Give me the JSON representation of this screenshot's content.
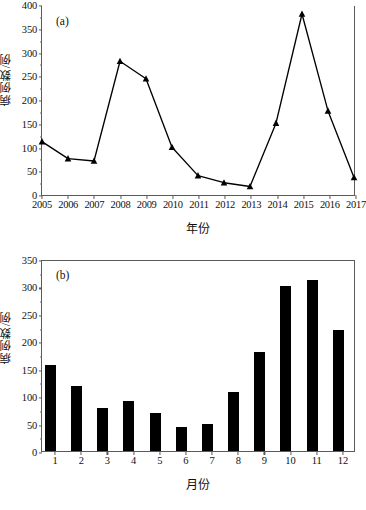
{
  "figure": {
    "background": "#ffffff",
    "line_color": "#000000",
    "bar_color": "#000000",
    "axis_color": "#5a5a5a"
  },
  "panel_a": {
    "tag": "(a)",
    "xlabel": "年份",
    "ylabel": "病例数/例"
  },
  "panel_b": {
    "tag": "(b)",
    "xlabel": "月份",
    "ylabel": "病例数/例"
  },
  "chart_data": [
    {
      "type": "line",
      "panel": "(a)",
      "title": "",
      "xlabel": "年份",
      "ylabel": "病例数/例",
      "categories": [
        "2005",
        "2006",
        "2007",
        "2008",
        "2009",
        "2010",
        "2011",
        "2012",
        "2013",
        "2014",
        "2015",
        "2016",
        "2017"
      ],
      "values": [
        113,
        77,
        72,
        283,
        246,
        101,
        41,
        26,
        18,
        152,
        383,
        178,
        37
      ],
      "marker": "triangle-filled",
      "ylim": [
        0,
        400
      ],
      "yticks": [
        0,
        50,
        100,
        150,
        200,
        250,
        300,
        350,
        400
      ],
      "ytick_labels": [
        "0",
        "50",
        "100",
        "150",
        "200",
        "250",
        "300",
        "350",
        "400"
      ],
      "grid": false,
      "legend": "none"
    },
    {
      "type": "bar",
      "panel": "(b)",
      "title": "",
      "xlabel": "月份",
      "ylabel": "病例数/例",
      "categories": [
        "1",
        "2",
        "3",
        "4",
        "5",
        "6",
        "7",
        "8",
        "9",
        "10",
        "11",
        "12"
      ],
      "values": [
        157,
        118,
        79,
        92,
        69,
        43,
        50,
        107,
        181,
        300,
        311,
        221
      ],
      "ylim": [
        0,
        350
      ],
      "yticks": [
        0,
        50,
        100,
        150,
        200,
        250,
        300,
        350
      ],
      "ytick_labels": [
        "0",
        "50",
        "100",
        "150",
        "200",
        "250",
        "300",
        "350"
      ],
      "grid": false,
      "legend": "none"
    }
  ]
}
